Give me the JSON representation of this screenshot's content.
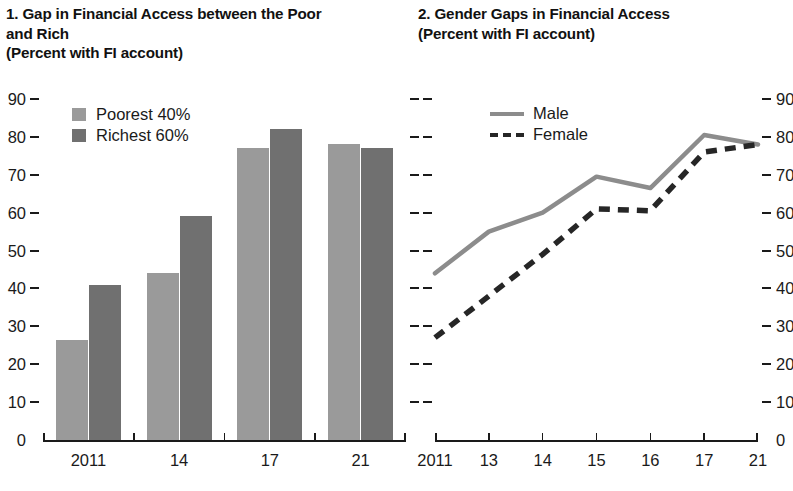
{
  "panel_left": {
    "title": "1. Gap in Financial Access between the Poor\n    and Rich\n    (Percent with FI account)",
    "legend": [
      {
        "label": "Poorest 40%",
        "color": "#9a9a9a"
      },
      {
        "label": "Richest 60%",
        "color": "#707070"
      }
    ]
  },
  "panel_right": {
    "title": "2. Gender Gaps in Financial Access\n    (Percent with FI account)",
    "legend": [
      {
        "label": "Male",
        "style": "solid",
        "color": "#8c8c8c"
      },
      {
        "label": "Female",
        "style": "dashed",
        "color": "#262626"
      }
    ]
  },
  "chart_data": [
    {
      "type": "bar",
      "title": "1. Gap in Financial Access between the Poor and Rich",
      "subtitle": "(Percent with FI account)",
      "xlabel": "",
      "ylabel": "",
      "ylim": [
        0,
        90
      ],
      "yticks": [
        0,
        10,
        20,
        30,
        40,
        50,
        60,
        70,
        80,
        90
      ],
      "ytick_labels": [
        "0",
        "10",
        "20",
        "30",
        "40",
        "50",
        "60",
        "70",
        "80",
        "90"
      ],
      "categories": [
        "2011",
        "14",
        "17",
        "21"
      ],
      "grid": false,
      "legend_position": "top-left",
      "series": [
        {
          "name": "Poorest 40%",
          "color": "#9a9a9a",
          "values": [
            26.5,
            44,
            77,
            78
          ]
        },
        {
          "name": "Richest 60%",
          "color": "#707070",
          "values": [
            41,
            59,
            82,
            77
          ]
        }
      ]
    },
    {
      "type": "line",
      "title": "2. Gender Gaps in Financial Access",
      "subtitle": "(Percent with FI account)",
      "xlabel": "",
      "ylabel": "",
      "ylim": [
        0,
        90
      ],
      "yticks": [
        0,
        10,
        20,
        30,
        40,
        50,
        60,
        70,
        80,
        90
      ],
      "ytick_labels": [
        "0",
        "10",
        "20",
        "30",
        "40",
        "50",
        "60",
        "70",
        "80",
        "90"
      ],
      "x": [
        "2011",
        "13",
        "14",
        "15",
        "16",
        "17",
        "21"
      ],
      "grid": false,
      "legend_position": "top-left",
      "series": [
        {
          "name": "Male",
          "style": "solid",
          "color": "#8c8c8c",
          "values": [
            44,
            55,
            60,
            69.5,
            66.5,
            80.5,
            78
          ]
        },
        {
          "name": "Female",
          "style": "dashed",
          "color": "#262626",
          "values": [
            27,
            38,
            49,
            61,
            60.5,
            76,
            78
          ]
        }
      ]
    }
  ]
}
